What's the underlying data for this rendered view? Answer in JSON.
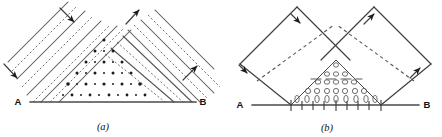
{
  "figure": {
    "kind": "wave-interference-diagram-pair",
    "background_color": "#ffffff",
    "ink_color": "#333333"
  },
  "panels": [
    {
      "id": "a",
      "caption": "(a)",
      "left_label": "A",
      "right_label": "B",
      "description": "Two crossed plane-wave trains drawn as alternating solid and dashed wavefronts; their overlap forms a triangular crosshatch interference region with nodal dots at the crossings.",
      "baseline": {
        "x1": 30,
        "y1": 102,
        "x2": 196,
        "y2": 102
      },
      "label_a": {
        "x": 18,
        "y": 105
      },
      "label_b": {
        "x": 201,
        "y": 105
      },
      "caption_pos": {
        "x": 103,
        "y": 130
      },
      "wavefront_count": 9,
      "wavefront_style": [
        "solid",
        "dashed"
      ],
      "node_dot_count": 34,
      "arrows": [
        {
          "name": "arrow-left-beam-top",
          "direction": "down-right",
          "x": 73,
          "y": 17
        },
        {
          "name": "arrow-left-beam-bottom",
          "direction": "down-right",
          "x": 14,
          "y": 73
        },
        {
          "name": "arrow-right-beam-top",
          "direction": "up-right",
          "x": 132,
          "y": 16
        },
        {
          "name": "arrow-right-beam-bottom",
          "direction": "up-right",
          "x": 190,
          "y": 72
        }
      ]
    },
    {
      "id": "b",
      "caption": "(b)",
      "left_label": "A",
      "right_label": "B",
      "description": "The same two beams drawn as outlined bundles with a dashed centre ray; the overlap triangle is stippled with small ellipses representing the interference maxima.",
      "baseline": {
        "x1": 252,
        "y1": 105,
        "x2": 419,
        "y2": 105
      },
      "label_a": {
        "x": 240,
        "y": 108
      },
      "label_b": {
        "x": 424,
        "y": 108
      },
      "caption_pos": {
        "x": 327,
        "y": 131
      },
      "tick_count": 9,
      "ellipse_rows": 4,
      "ellipse_count": 27,
      "arrows": [
        {
          "name": "arrow-left-beam-upper",
          "direction": "down-right",
          "x": 298,
          "y": 21
        },
        {
          "name": "arrow-left-beam-lower",
          "direction": "down-right",
          "x": 249,
          "y": 70
        },
        {
          "name": "arrow-right-beam-upper",
          "direction": "up-right",
          "x": 371,
          "y": 22
        },
        {
          "name": "arrow-right-beam-lower",
          "direction": "up-right",
          "x": 417,
          "y": 71
        }
      ]
    }
  ]
}
